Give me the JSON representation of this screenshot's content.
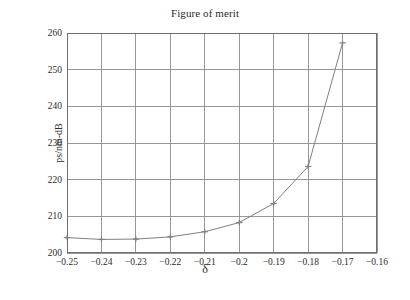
{
  "chart_data": {
    "type": "line",
    "title": "Figure of merit",
    "xlabel": "δ",
    "ylabel": "ps/nm-dB",
    "x": [
      -0.25,
      -0.24,
      -0.23,
      -0.22,
      -0.21,
      -0.2,
      -0.19,
      -0.18,
      -0.17
    ],
    "values": [
      204.2,
      203.7,
      203.8,
      204.4,
      205.8,
      208.3,
      213.5,
      223.6,
      257.3
    ],
    "series": [
      {
        "name": "Figure of merit",
        "values": [
          204.2,
          203.7,
          203.8,
          204.4,
          205.8,
          208.3,
          213.5,
          223.6,
          257.3
        ]
      }
    ],
    "xlim": [
      -0.25,
      -0.16
    ],
    "ylim": [
      200,
      260
    ],
    "xticks": [
      -0.25,
      -0.24,
      -0.23,
      -0.22,
      -0.21,
      -0.2,
      -0.19,
      -0.18,
      -0.17,
      -0.16
    ],
    "xtick_labels": [
      "−0.25",
      "−0.24",
      "−0.23",
      "−0.22",
      "−0.21",
      "−0.2",
      "−0.19",
      "−0.18",
      "−0.17",
      "−0.16"
    ],
    "yticks": [
      200,
      210,
      220,
      230,
      240,
      250,
      260
    ],
    "ytick_labels": [
      "200",
      "210",
      "220",
      "230",
      "240",
      "250",
      "260"
    ],
    "grid": true,
    "legend": null,
    "marker": "plus",
    "line_color": "#808080",
    "grid_color": "#8c8c8c",
    "axis_color": "#6e6e6e",
    "background": "#ffffff",
    "text_color": "#2b2b2b"
  }
}
